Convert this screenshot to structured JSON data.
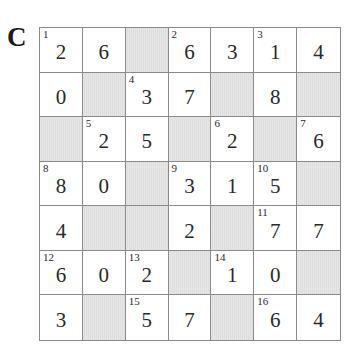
{
  "puzzle": {
    "label": "C",
    "rows": 7,
    "cols": 7,
    "colors": {
      "shaded": "#e3e3e3",
      "border": "#8a8a8a",
      "text": "#2a2a2a"
    },
    "cells": [
      [
        {
          "clue": "1",
          "value": "2"
        },
        {
          "clue": "",
          "value": "6"
        },
        {
          "shaded": true
        },
        {
          "clue": "2",
          "value": "6"
        },
        {
          "clue": "",
          "value": "3"
        },
        {
          "clue": "3",
          "value": "1"
        },
        {
          "clue": "",
          "value": "4"
        }
      ],
      [
        {
          "clue": "",
          "value": "0"
        },
        {
          "shaded": true
        },
        {
          "clue": "4",
          "value": "3"
        },
        {
          "clue": "",
          "value": "7"
        },
        {
          "shaded": true
        },
        {
          "clue": "",
          "value": "8"
        },
        {
          "shaded": true
        }
      ],
      [
        {
          "shaded": true
        },
        {
          "clue": "5",
          "value": "2"
        },
        {
          "clue": "",
          "value": "5"
        },
        {
          "shaded": true
        },
        {
          "clue": "6",
          "value": "2"
        },
        {
          "shaded": true
        },
        {
          "clue": "7",
          "value": "6"
        }
      ],
      [
        {
          "clue": "8",
          "value": "8"
        },
        {
          "clue": "",
          "value": "0"
        },
        {
          "shaded": true
        },
        {
          "clue": "9",
          "value": "3"
        },
        {
          "clue": "",
          "value": "1"
        },
        {
          "clue": "10",
          "value": "5"
        },
        {
          "shaded": true
        }
      ],
      [
        {
          "clue": "",
          "value": "4"
        },
        {
          "shaded": true
        },
        {
          "shaded": true
        },
        {
          "clue": "",
          "value": "2"
        },
        {
          "shaded": true
        },
        {
          "clue": "11",
          "value": "7"
        },
        {
          "clue": "",
          "value": "7"
        }
      ],
      [
        {
          "clue": "12",
          "value": "6"
        },
        {
          "clue": "",
          "value": "0"
        },
        {
          "clue": "13",
          "value": "2"
        },
        {
          "shaded": true
        },
        {
          "clue": "14",
          "value": "1"
        },
        {
          "clue": "",
          "value": "0"
        },
        {
          "shaded": true
        }
      ],
      [
        {
          "clue": "",
          "value": "3"
        },
        {
          "shaded": true
        },
        {
          "clue": "15",
          "value": "5"
        },
        {
          "clue": "",
          "value": "7"
        },
        {
          "shaded": true
        },
        {
          "clue": "16",
          "value": "6"
        },
        {
          "clue": "",
          "value": "4"
        }
      ]
    ]
  }
}
